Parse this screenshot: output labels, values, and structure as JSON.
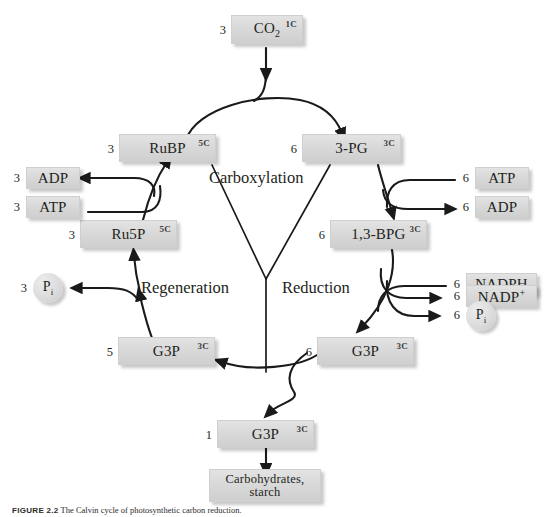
{
  "figure": {
    "caption_label": "FIGURE 2.2",
    "caption_text": "The Calvin cycle of photosynthetic carbon reduction."
  },
  "phases": [
    {
      "id": "carboxylation",
      "label": "Carboxylation"
    },
    {
      "id": "reduction",
      "label": "Reduction"
    },
    {
      "id": "regeneration",
      "label": "Regeneration"
    }
  ],
  "nodes": {
    "co2": {
      "name": "CO",
      "sub": "2",
      "carbon": "1C",
      "coef": "3"
    },
    "rubp": {
      "name": "RuBP",
      "carbon": "5C",
      "coef": "3"
    },
    "pg3": {
      "name": "3-PG",
      "carbon": "3C",
      "coef": "6"
    },
    "bpg": {
      "name": "1,3-BPG",
      "carbon": "3C",
      "coef": "6"
    },
    "ru5p": {
      "name": "Ru5P",
      "carbon": "5C",
      "coef": "3"
    },
    "g3p_left": {
      "name": "G3P",
      "carbon": "3C",
      "coef": "5"
    },
    "g3p_right": {
      "name": "G3P",
      "carbon": "3C",
      "coef": "6"
    },
    "g3p_out": {
      "name": "G3P",
      "carbon": "3C",
      "coef": "1"
    },
    "carbs": {
      "line1": "Carbohydrates,",
      "line2": "starch"
    },
    "atp_right": {
      "name": "ATP",
      "coef": "6"
    },
    "adp_right": {
      "name": "ADP",
      "coef": "6"
    },
    "nadph": {
      "name": "NADPH",
      "coef": "6"
    },
    "nadp_plus": {
      "name": "NADP",
      "sup": "+",
      "coef": "6"
    },
    "pi_right": {
      "name": "P",
      "sub": "i",
      "coef": "6"
    },
    "atp_left": {
      "name": "ATP",
      "coef": "3"
    },
    "adp_left": {
      "name": "ADP",
      "coef": "3"
    },
    "pi_left": {
      "name": "P",
      "sub": "i",
      "coef": "3"
    }
  },
  "colors": {
    "box_fill": "#d9d9d9",
    "box_edge": "#cfcfcf",
    "ink": "#231f20",
    "page": "#ffffff"
  }
}
